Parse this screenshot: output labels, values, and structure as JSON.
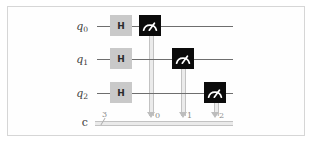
{
  "figure": {
    "kind": "quantum-circuit-diagram",
    "background_color": "#ffffff",
    "frame_border_color": "#d6d6d6"
  },
  "colors": {
    "wire": "#6e6e6e",
    "classical_wire": "#c2c2c2",
    "h_gate_fill": "#c9c9c9",
    "h_gate_text": "#2b2b2b",
    "measure_gate_fill": "#0b0b0b",
    "measure_gate_symbol": "#ffffff",
    "connector": "#c2c2c2",
    "label_text": "#3d3d3d",
    "index_text": "#8a8a8a"
  },
  "registers": {
    "quantum": [
      {
        "label": "q",
        "index": "0",
        "y": 26
      },
      {
        "label": "q",
        "index": "1",
        "y": 59
      },
      {
        "label": "q",
        "index": "2",
        "y": 93
      }
    ],
    "classical": {
      "label": "c",
      "size": "3",
      "y": 122,
      "bit_indices": [
        "0",
        "1",
        "2"
      ]
    }
  },
  "gates": {
    "hadamard": {
      "symbol": "H",
      "name": "hadamard-gate",
      "instances": [
        {
          "qubit": "q0",
          "x": 110,
          "y": 15
        },
        {
          "qubit": "q1",
          "x": 110,
          "y": 48
        },
        {
          "qubit": "q2",
          "x": 110,
          "y": 82
        }
      ]
    },
    "measure": {
      "name": "measure-gate",
      "instances": [
        {
          "qubit": "q0",
          "clbit": "0",
          "x": 139,
          "y": 15
        },
        {
          "qubit": "q1",
          "clbit": "1",
          "x": 172,
          "y": 48
        },
        {
          "qubit": "q2",
          "clbit": "2",
          "x": 204,
          "y": 82
        }
      ]
    }
  },
  "icons": {
    "measure": "measurement-meter-icon"
  }
}
